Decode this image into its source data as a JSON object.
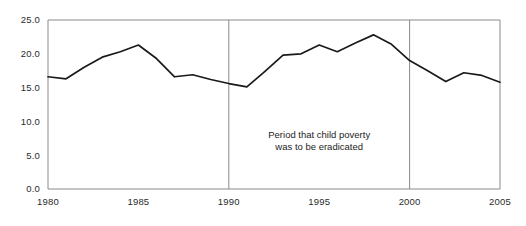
{
  "chart_data": {
    "type": "line",
    "title": "",
    "subtitle": "",
    "xlabel": "",
    "ylabel": "",
    "xlim": [
      1980,
      2005
    ],
    "ylim": [
      0.0,
      25.0
    ],
    "grid": false,
    "legend": "none",
    "x": [
      1980,
      1981,
      1982,
      1983,
      1984,
      1985,
      1986,
      1987,
      1988,
      1989,
      1990,
      1991,
      1992,
      1993,
      1994,
      1995,
      1996,
      1997,
      1998,
      1999,
      2000,
      2001,
      2002,
      2003,
      2004,
      2005
    ],
    "series": [
      {
        "name": "Child poverty rate",
        "values": [
          16.6,
          16.3,
          18.0,
          19.5,
          20.3,
          21.3,
          19.3,
          16.6,
          16.9,
          16.2,
          15.6,
          15.1,
          17.4,
          19.8,
          20.0,
          21.3,
          20.3,
          21.6,
          22.8,
          21.4,
          19.0,
          17.5,
          15.9,
          17.2,
          16.8,
          15.8
        ]
      }
    ],
    "x_tick_labels": [
      "1980",
      "1985",
      "1990",
      "1995",
      "2000",
      "2005"
    ],
    "x_tick_values": [
      1980,
      1985,
      1990,
      1995,
      2000,
      2005
    ],
    "y_tick_labels": [
      "0.0",
      "5.0",
      "10.0",
      "15.0",
      "20.0",
      "25.0"
    ],
    "y_tick_values": [
      0.0,
      5.0,
      10.0,
      15.0,
      20.0,
      25.0
    ],
    "annotations": [
      {
        "name": "period-annotation",
        "line1": "Period that child poverty",
        "line2": "was to be eradicated",
        "x_center": 1995,
        "y_center": 7.5
      }
    ],
    "markers": [
      {
        "name": "marker-1990",
        "x": 1990,
        "label": "1990"
      },
      {
        "name": "marker-2000",
        "x": 2000,
        "label": "2000"
      }
    ],
    "colors": {
      "line": "#1a1a1a",
      "axis": "#8a8a8a",
      "marker": "#8a8a8a",
      "text": "#2b2b2b",
      "background": "#ffffff"
    }
  }
}
